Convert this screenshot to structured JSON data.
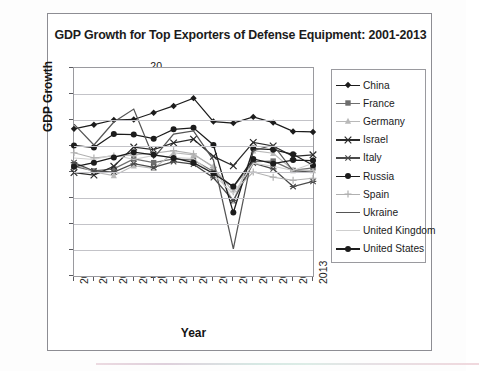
{
  "chart_data": {
    "type": "line",
    "title": "GDP Growth for Top Exporters of Defense Equipment: 2001-2013",
    "xlabel": "Year",
    "ylabel": "GDP Growth",
    "categories": [
      "2001",
      "2002",
      "2003",
      "2004",
      "2005",
      "2006",
      "2007",
      "2008",
      "2009",
      "2010",
      "2011",
      "2012",
      "2013"
    ],
    "ylim": [
      -20,
      20
    ],
    "ytick_step": 5,
    "yticks": [
      "20",
      "15",
      "10",
      "5",
      "0",
      "-5",
      "-10",
      "-15",
      "-20"
    ],
    "grid": true,
    "legend_position": "right",
    "series": [
      {
        "name": "China",
        "marker": "diamond",
        "color": "#1c1c1c",
        "values": [
          8.3,
          9.1,
          10.0,
          10.1,
          11.4,
          12.7,
          14.2,
          9.7,
          9.4,
          10.6,
          9.5,
          7.8,
          7.7
        ]
      },
      {
        "name": "France",
        "marker": "square",
        "color": "#6e6e6e",
        "values": [
          1.1,
          0.2,
          0.6,
          2.5,
          1.8,
          2.5,
          2.3,
          0.1,
          -2.9,
          2.0,
          2.1,
          0.3,
          0.8
        ]
      },
      {
        "name": "Germany",
        "marker": "triangle",
        "color": "#b9b9b9",
        "values": [
          1.7,
          0.0,
          -0.7,
          1.2,
          0.7,
          3.7,
          3.3,
          1.1,
          -5.6,
          4.1,
          3.6,
          0.4,
          0.3
        ]
      },
      {
        "name": "Israel",
        "marker": "x",
        "color": "#2a2a2a",
        "values": [
          -0.1,
          -0.6,
          1.1,
          4.8,
          4.3,
          5.6,
          6.3,
          3.0,
          1.2,
          5.7,
          5.0,
          3.0,
          3.3
        ]
      },
      {
        "name": "Italy",
        "marker": "asterisk",
        "color": "#4a4a4a",
        "values": [
          1.8,
          0.2,
          0.0,
          1.6,
          0.9,
          2.0,
          1.5,
          -1.1,
          -5.5,
          1.7,
          0.6,
          -2.8,
          -1.8
        ]
      },
      {
        "name": "Russia",
        "marker": "circle",
        "color": "#1c1c1c",
        "values": [
          5.1,
          4.7,
          7.3,
          7.2,
          6.4,
          8.2,
          8.5,
          5.2,
          -7.8,
          4.5,
          4.3,
          3.4,
          1.3
        ]
      },
      {
        "name": "Spain",
        "marker": "plus",
        "color": "#b0b0b0",
        "values": [
          3.7,
          2.7,
          3.1,
          3.3,
          3.6,
          4.1,
          3.5,
          0.9,
          -3.8,
          0.0,
          -1.0,
          -1.6,
          -1.2
        ]
      },
      {
        "name": "Ukraine",
        "marker": "none",
        "color": "#555555",
        "values": [
          9.2,
          5.2,
          9.6,
          12.1,
          2.7,
          7.3,
          7.9,
          2.3,
          -14.8,
          4.1,
          5.2,
          0.2,
          0.0
        ]
      },
      {
        "name": "United Kingdom",
        "marker": "none",
        "color": "#cfcfcf",
        "values": [
          2.7,
          2.4,
          3.3,
          2.4,
          3.2,
          2.8,
          2.6,
          -0.5,
          -4.2,
          1.7,
          1.1,
          0.3,
          1.7
        ]
      },
      {
        "name": "United States",
        "marker": "circle",
        "color": "#1c1c1c",
        "values": [
          1.0,
          1.8,
          2.8,
          3.8,
          3.3,
          2.7,
          1.8,
          -0.3,
          -2.8,
          2.5,
          1.6,
          2.3,
          2.2
        ]
      }
    ]
  }
}
